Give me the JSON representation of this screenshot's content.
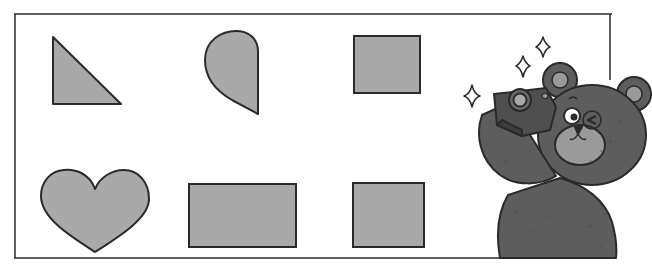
{
  "scene": {
    "description": "Worksheet with six gray shapes in a frame and a bear taking a photo",
    "colors": {
      "shape_fill": "#a9a9a9",
      "outline": "#2a2a2a",
      "bear_fur": "#5d5d5d",
      "bear_fur_dark": "#4a4a4a",
      "bear_muzzle": "#9a9a9a",
      "camera": "#4f4f4f",
      "background": "#ffffff"
    },
    "shapes": [
      {
        "name": "right-triangle",
        "row": 1,
        "col": 1
      },
      {
        "name": "teardrop",
        "row": 1,
        "col": 2
      },
      {
        "name": "square",
        "row": 1,
        "col": 3
      },
      {
        "name": "heart",
        "row": 2,
        "col": 1
      },
      {
        "name": "rectangle",
        "row": 2,
        "col": 2
      },
      {
        "name": "square",
        "row": 2,
        "col": 3
      }
    ],
    "character": {
      "name": "bear",
      "holding": "camera",
      "decorations": "sparkles"
    }
  }
}
